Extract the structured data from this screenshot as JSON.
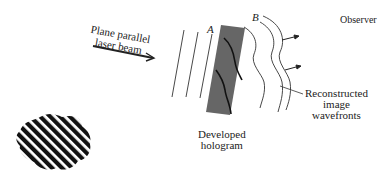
{
  "labels": {
    "beam_line1": "Plane parallel",
    "beam_line2": "laser beam",
    "marker_a": "A",
    "marker_b": "B",
    "observer": "Observer",
    "recon_line1": "Reconstructed",
    "recon_line2": "image",
    "recon_line3": "wavefronts",
    "holo_line1": "Developed",
    "holo_line2": "hologram"
  },
  "colors": {
    "ink": "#222222",
    "hologram": "#666666"
  }
}
